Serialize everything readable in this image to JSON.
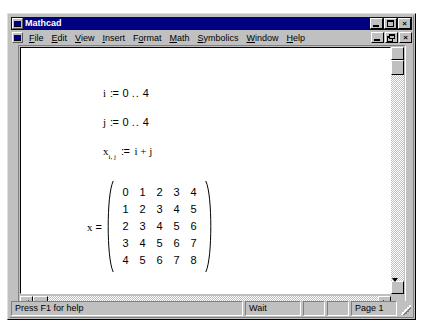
{
  "window": {
    "title": "Mathcad",
    "title_icon": "mathcad-icon",
    "controls": {
      "minimize": "minimize-icon",
      "maximize": "maximize-icon",
      "close": "close-icon"
    }
  },
  "document_window": {
    "icon": "document-icon",
    "controls": {
      "minimize": "minimize-icon",
      "restore": "restore-icon",
      "close": "close-icon"
    }
  },
  "menu": {
    "items": [
      {
        "label": "File",
        "accel": "F"
      },
      {
        "label": "Edit",
        "accel": "E"
      },
      {
        "label": "View",
        "accel": "V"
      },
      {
        "label": "Insert",
        "accel": "I"
      },
      {
        "label": "Format",
        "accel": "o"
      },
      {
        "label": "Math",
        "accel": "M"
      },
      {
        "label": "Symbolics",
        "accel": "S"
      },
      {
        "label": "Window",
        "accel": "W"
      },
      {
        "label": "Help",
        "accel": "H"
      }
    ]
  },
  "worksheet": {
    "regions": [
      {
        "name": "range-definition-i",
        "variable": "i",
        "operator": ":=",
        "range_start": "0",
        "range_dots": "..",
        "range_end": "4"
      },
      {
        "name": "range-definition-j",
        "variable": "j",
        "operator": ":=",
        "range_start": "0",
        "range_dots": "..",
        "range_end": "4"
      },
      {
        "name": "matrix-element-definition",
        "variable": "x",
        "subscript": "i, j",
        "operator": ":=",
        "expression": "i + j"
      }
    ],
    "matrix_result": {
      "name": "matrix-output",
      "label": "x",
      "operator": "=",
      "rows": [
        [
          "0",
          "1",
          "2",
          "3",
          "4"
        ],
        [
          "1",
          "2",
          "3",
          "4",
          "5"
        ],
        [
          "2",
          "3",
          "4",
          "5",
          "6"
        ],
        [
          "3",
          "4",
          "5",
          "6",
          "7"
        ],
        [
          "4",
          "5",
          "6",
          "7",
          "8"
        ]
      ]
    }
  },
  "scrollbars": {
    "horizontal": {
      "left_arrow": "arrow-left-icon",
      "right_arrow": "arrow-right-icon"
    },
    "vertical": {
      "up_arrow": "arrow-up-icon",
      "down_arrow": "arrow-down-icon"
    }
  },
  "status_bar": {
    "help_text": "Press F1 for help",
    "mode": "Wait",
    "aux1": "",
    "aux2": "",
    "page": "Page 1"
  },
  "colors": {
    "titlebar": "#000080",
    "chrome": "#c0c0c0",
    "page": "#ffffff",
    "text": "#000000"
  }
}
